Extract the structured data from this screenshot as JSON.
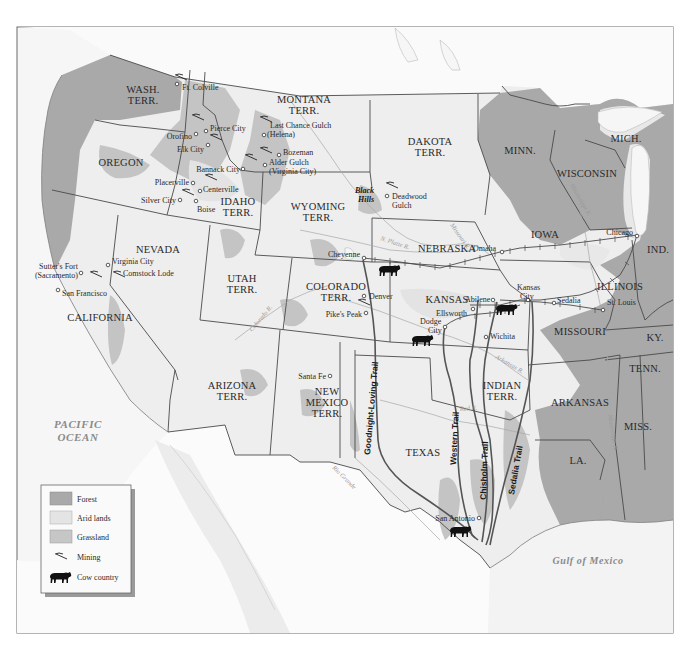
{
  "colors": {
    "forest": "#a9a9a9",
    "arid": "#e4e4e4",
    "grassland": "#c6c6c6",
    "land": "#efefef",
    "ocean": "#f4f4f4",
    "outside": "#ffffff",
    "border": "#4a4a4a"
  },
  "water_bodies": {
    "pacific_line1": "PACIFIC",
    "pacific_line2": "OCEAN",
    "gulf": "Gulf of Mexico"
  },
  "states": {
    "wash_1": "WASH.",
    "wash_2": "TERR.",
    "oregon": "OREGON",
    "idaho_1": "IDAHO",
    "idaho_2": "TERR.",
    "montana_1": "MONTANA",
    "montana_2": "TERR.",
    "wyoming_1": "WYOMING",
    "wyoming_2": "TERR.",
    "dakota_1": "DAKOTA",
    "dakota_2": "TERR.",
    "minn": "MINN.",
    "wisconsin": "WISCONSIN",
    "mich": "MICH.",
    "iowa": "IOWA",
    "nebraska": "NEBRASKA",
    "nevada": "NEVADA",
    "california": "CALIFORNIA",
    "utah_1": "UTAH",
    "utah_2": "TERR.",
    "colorado_1": "COLORADO",
    "colorado_2": "TERR.",
    "kansas": "KANSAS",
    "ind": "IND.",
    "illinois": "ILLINOIS",
    "missouri": "MISSOURI",
    "ky": "KY.",
    "tenn": "TENN.",
    "arizona_1": "ARIZONA",
    "arizona_2": "TERR.",
    "newmexico_1": "NEW",
    "newmexico_2": "MEXICO",
    "newmexico_3": "TERR.",
    "indian_1": "INDIAN",
    "indian_2": "TERR.",
    "arkansas": "ARKANSAS",
    "miss": "MISS.",
    "texas": "TEXAS",
    "la": "LA."
  },
  "cities": {
    "ft_colville": "Ft. Colville",
    "pierce_city": "Pierce City",
    "orofino": "Orofino",
    "elk_city": "Elk City",
    "last_chance_1": "Last Chance Gulch",
    "last_chance_2": "(Helena)",
    "bozeman": "Bozeman",
    "alder_1": "Alder Gulch",
    "alder_2": "(Virginia City)",
    "bannack": "Bannack City",
    "placerville": "Placerville",
    "centerville": "Centerville",
    "silver_city": "Silver City",
    "boise": "Boise",
    "deadwood_1": "Deadwood",
    "deadwood_2": "Gulch",
    "black_hills_1": "Black",
    "black_hills_2": "Hills",
    "cheyenne": "Cheyenne",
    "omaha": "Omaha",
    "chicago": "Chicago",
    "virginia_city": "Virginia City",
    "comstock": "Comstock Lode",
    "sutters_1": "Sutter's Fort",
    "sutters_2": "(Sacramento)",
    "san_francisco": "San Francisco",
    "denver": "Denver",
    "pikes_peak": "Pike's Peak",
    "kansas_city_1": "Kansas",
    "kansas_city_2": "City",
    "abilene": "Abilene",
    "ellsworth": "Ellsworth",
    "sedalia": "Sedalia",
    "st_louis": "St. Louis",
    "dodge_1": "Dodge",
    "dodge_2": "City",
    "wichita": "Wichita",
    "santa_fe": "Santa Fe",
    "san_antonio": "San Antonio"
  },
  "rivers": {
    "missouri": "Missouri R.",
    "mississippi": "Mississippi R.",
    "n_platte": "N. Platte R.",
    "colorado": "Colorado R.",
    "arkansas": "Arkansas R.",
    "red": "Red R.",
    "rio_grande": "Rio Grande"
  },
  "trails": {
    "goodnight": "Goodnight-Loving Trail",
    "western": "Western Trail",
    "chisholm": "Chisholm Trail",
    "sedalia": "Sedalia Trail"
  },
  "legend": {
    "items": [
      {
        "label": "Forest",
        "swatch": "forest"
      },
      {
        "label": "Arid lands",
        "swatch": "arid"
      },
      {
        "label": "Grassland",
        "swatch": "grassland"
      },
      {
        "label": "Mining",
        "swatch": "mining-icon"
      },
      {
        "label": "Cow country",
        "swatch": "cow-icon"
      }
    ]
  }
}
